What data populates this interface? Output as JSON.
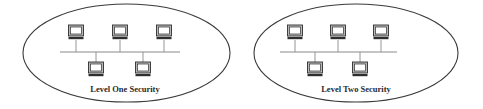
{
  "colors": {
    "outline": "#3a3a3a",
    "bus": "#8a8a8a",
    "monitor_body": "#b8b8b8",
    "monitor_screen": "#ffffff",
    "monitor_border": "#2e2e2e",
    "text": "#2a2a2a"
  },
  "diagrams": [
    {
      "label": "Level One Security",
      "ellipse": {
        "cx": 126.5,
        "cy": 53,
        "rx": 103.5,
        "ry": 49
      },
      "bus": {
        "x1": 60,
        "x2": 180,
        "y": 52
      },
      "top_computers": [
        76,
        120,
        164
      ],
      "bottom_computers": [
        96,
        143
      ],
      "label_pos": {
        "x": 125,
        "y": 92
      }
    },
    {
      "label": "Level Two Security",
      "ellipse": {
        "cx": 356,
        "cy": 53,
        "rx": 102,
        "ry": 49
      },
      "bus": {
        "x1": 280,
        "x2": 397,
        "y": 52
      },
      "top_computers": [
        295,
        338,
        381
      ],
      "bottom_computers": [
        315,
        360
      ],
      "label_pos": {
        "x": 356,
        "y": 92
      }
    }
  ]
}
